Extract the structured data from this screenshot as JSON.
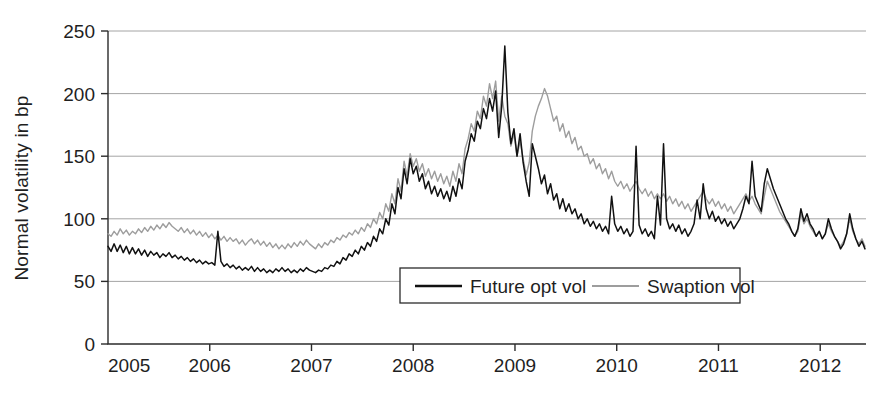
{
  "chart_data": {
    "type": "line",
    "title": "",
    "subtitle": "",
    "xlabel": "",
    "ylabel": "Normal volatility in bp",
    "xlim": [
      2005.0,
      2012.45
    ],
    "ylim": [
      0,
      250
    ],
    "yticks": [
      0,
      50,
      100,
      150,
      200,
      250
    ],
    "ytick_labels": [
      "0",
      "50",
      "100",
      "150",
      "200",
      "250"
    ],
    "xticks": [
      2005,
      2006,
      2007,
      2008,
      2009,
      2010,
      2011,
      2012
    ],
    "xtick_labels": [
      "2005",
      "2006",
      "2007",
      "2008",
      "2009",
      "2010",
      "2011",
      "2012"
    ],
    "grid": "horizontal-only",
    "grid_color": "#9a9a9a",
    "legend_position": "lower-center",
    "series": [
      {
        "name": "Future opt vol",
        "color": "#111111",
        "x": [
          2005.0,
          2005.03,
          2005.06,
          2005.09,
          2005.12,
          2005.15,
          2005.18,
          2005.21,
          2005.24,
          2005.27,
          2005.3,
          2005.33,
          2005.36,
          2005.39,
          2005.42,
          2005.45,
          2005.48,
          2005.51,
          2005.54,
          2005.57,
          2005.6,
          2005.63,
          2005.66,
          2005.69,
          2005.72,
          2005.75,
          2005.78,
          2005.81,
          2005.84,
          2005.87,
          2005.9,
          2005.93,
          2005.96,
          2005.99,
          2006.02,
          2006.05,
          2006.08,
          2006.11,
          2006.14,
          2006.17,
          2006.2,
          2006.23,
          2006.26,
          2006.29,
          2006.32,
          2006.35,
          2006.38,
          2006.41,
          2006.44,
          2006.47,
          2006.5,
          2006.53,
          2006.56,
          2006.59,
          2006.62,
          2006.65,
          2006.68,
          2006.71,
          2006.74,
          2006.77,
          2006.8,
          2006.83,
          2006.86,
          2006.89,
          2006.92,
          2006.95,
          2006.98,
          2007.01,
          2007.04,
          2007.07,
          2007.1,
          2007.13,
          2007.16,
          2007.19,
          2007.22,
          2007.25,
          2007.28,
          2007.31,
          2007.34,
          2007.37,
          2007.4,
          2007.43,
          2007.46,
          2007.49,
          2007.52,
          2007.55,
          2007.58,
          2007.61,
          2007.64,
          2007.67,
          2007.7,
          2007.73,
          2007.76,
          2007.79,
          2007.82,
          2007.85,
          2007.88,
          2007.91,
          2007.94,
          2007.97,
          2008.0,
          2008.03,
          2008.06,
          2008.09,
          2008.12,
          2008.15,
          2008.18,
          2008.21,
          2008.24,
          2008.27,
          2008.3,
          2008.33,
          2008.36,
          2008.39,
          2008.42,
          2008.45,
          2008.48,
          2008.51,
          2008.54,
          2008.57,
          2008.6,
          2008.63,
          2008.66,
          2008.69,
          2008.72,
          2008.75,
          2008.78,
          2008.81,
          2008.84,
          2008.87,
          2008.9,
          2008.93,
          2008.96,
          2008.99,
          2009.02,
          2009.05,
          2009.08,
          2009.11,
          2009.14,
          2009.17,
          2009.2,
          2009.23,
          2009.26,
          2009.29,
          2009.32,
          2009.35,
          2009.38,
          2009.41,
          2009.44,
          2009.47,
          2009.5,
          2009.53,
          2009.56,
          2009.59,
          2009.62,
          2009.65,
          2009.68,
          2009.71,
          2009.74,
          2009.77,
          2009.8,
          2009.83,
          2009.86,
          2009.89,
          2009.92,
          2009.95,
          2009.98,
          2010.01,
          2010.04,
          2010.07,
          2010.1,
          2010.13,
          2010.16,
          2010.19,
          2010.22,
          2010.25,
          2010.28,
          2010.31,
          2010.34,
          2010.37,
          2010.4,
          2010.43,
          2010.46,
          2010.49,
          2010.52,
          2010.55,
          2010.58,
          2010.61,
          2010.64,
          2010.67,
          2010.7,
          2010.73,
          2010.76,
          2010.79,
          2010.82,
          2010.85,
          2010.88,
          2010.91,
          2010.94,
          2010.97,
          2011.0,
          2011.03,
          2011.06,
          2011.09,
          2011.12,
          2011.15,
          2011.18,
          2011.21,
          2011.24,
          2011.27,
          2011.3,
          2011.33,
          2011.36,
          2011.39,
          2011.42,
          2011.45,
          2011.48,
          2011.51,
          2011.54,
          2011.57,
          2011.6,
          2011.63,
          2011.66,
          2011.69,
          2011.72,
          2011.75,
          2011.78,
          2011.81,
          2011.84,
          2011.87,
          2011.9,
          2011.93,
          2011.96,
          2011.99,
          2012.02,
          2012.05,
          2012.08,
          2012.11,
          2012.14,
          2012.17,
          2012.2,
          2012.23,
          2012.26,
          2012.29,
          2012.32,
          2012.35,
          2012.38,
          2012.41,
          2012.44
        ],
        "values": [
          78,
          74,
          80,
          74,
          79,
          73,
          78,
          72,
          77,
          72,
          76,
          71,
          75,
          70,
          74,
          71,
          73,
          69,
          72,
          70,
          73,
          69,
          71,
          68,
          70,
          67,
          69,
          66,
          68,
          65,
          67,
          64,
          66,
          64,
          65,
          63,
          90,
          66,
          62,
          64,
          61,
          63,
          60,
          62,
          59,
          61,
          59,
          62,
          58,
          61,
          58,
          60,
          57,
          59,
          57,
          60,
          58,
          61,
          58,
          60,
          57,
          59,
          57,
          60,
          58,
          61,
          59,
          58,
          57,
          59,
          58,
          61,
          60,
          63,
          62,
          66,
          64,
          69,
          67,
          72,
          70,
          75,
          72,
          78,
          75,
          81,
          78,
          86,
          82,
          92,
          88,
          100,
          95,
          112,
          104,
          125,
          116,
          140,
          128,
          148,
          136,
          142,
          130,
          136,
          124,
          130,
          120,
          126,
          118,
          124,
          116,
          122,
          114,
          126,
          118,
          132,
          124,
          146,
          155,
          168,
          162,
          178,
          172,
          188,
          180,
          196,
          186,
          202,
          165,
          190,
          238,
          185,
          160,
          172,
          150,
          168,
          145,
          130,
          118,
          160,
          150,
          140,
          128,
          135,
          120,
          128,
          115,
          120,
          108,
          116,
          106,
          112,
          104,
          108,
          100,
          104,
          96,
          100,
          94,
          98,
          92,
          96,
          90,
          94,
          88,
          118,
          96,
          90,
          94,
          88,
          92,
          86,
          90,
          158,
          95,
          88,
          92,
          86,
          90,
          84,
          118,
          95,
          160,
          100,
          92,
          96,
          90,
          95,
          88,
          92,
          86,
          90,
          96,
          115,
          100,
          128,
          108,
          100,
          106,
          98,
          102,
          96,
          100,
          94,
          98,
          92,
          96,
          100,
          108,
          118,
          112,
          146,
          118,
          112,
          106,
          128,
          140,
          132,
          124,
          118,
          112,
          106,
          100,
          96,
          90,
          86,
          92,
          108,
          98,
          104,
          96,
          92,
          86,
          90,
          84,
          88,
          100,
          92,
          86,
          82,
          76,
          80,
          88,
          104,
          92,
          84,
          78,
          82,
          76
        ]
      },
      {
        "name": "Swaption vol",
        "color": "#9d9d9d",
        "x": [
          2005.0,
          2005.03,
          2005.06,
          2005.09,
          2005.12,
          2005.15,
          2005.18,
          2005.21,
          2005.24,
          2005.27,
          2005.3,
          2005.33,
          2005.36,
          2005.39,
          2005.42,
          2005.45,
          2005.48,
          2005.51,
          2005.54,
          2005.57,
          2005.6,
          2005.63,
          2005.66,
          2005.69,
          2005.72,
          2005.75,
          2005.78,
          2005.81,
          2005.84,
          2005.87,
          2005.9,
          2005.93,
          2005.96,
          2005.99,
          2006.02,
          2006.05,
          2006.08,
          2006.11,
          2006.14,
          2006.17,
          2006.2,
          2006.23,
          2006.26,
          2006.29,
          2006.32,
          2006.35,
          2006.38,
          2006.41,
          2006.44,
          2006.47,
          2006.5,
          2006.53,
          2006.56,
          2006.59,
          2006.62,
          2006.65,
          2006.68,
          2006.71,
          2006.74,
          2006.77,
          2006.8,
          2006.83,
          2006.86,
          2006.89,
          2006.92,
          2006.95,
          2006.98,
          2007.01,
          2007.04,
          2007.07,
          2007.1,
          2007.13,
          2007.16,
          2007.19,
          2007.22,
          2007.25,
          2007.28,
          2007.31,
          2007.34,
          2007.37,
          2007.4,
          2007.43,
          2007.46,
          2007.49,
          2007.52,
          2007.55,
          2007.58,
          2007.61,
          2007.64,
          2007.67,
          2007.7,
          2007.73,
          2007.76,
          2007.79,
          2007.82,
          2007.85,
          2007.88,
          2007.91,
          2007.94,
          2007.97,
          2008.0,
          2008.03,
          2008.06,
          2008.09,
          2008.12,
          2008.15,
          2008.18,
          2008.21,
          2008.24,
          2008.27,
          2008.3,
          2008.33,
          2008.36,
          2008.39,
          2008.42,
          2008.45,
          2008.48,
          2008.51,
          2008.54,
          2008.57,
          2008.6,
          2008.63,
          2008.66,
          2008.69,
          2008.72,
          2008.75,
          2008.78,
          2008.81,
          2008.84,
          2008.87,
          2008.9,
          2008.93,
          2008.96,
          2008.99,
          2009.02,
          2009.05,
          2009.08,
          2009.11,
          2009.14,
          2009.17,
          2009.2,
          2009.23,
          2009.26,
          2009.29,
          2009.32,
          2009.35,
          2009.38,
          2009.41,
          2009.44,
          2009.47,
          2009.5,
          2009.53,
          2009.56,
          2009.59,
          2009.62,
          2009.65,
          2009.68,
          2009.71,
          2009.74,
          2009.77,
          2009.8,
          2009.83,
          2009.86,
          2009.89,
          2009.92,
          2009.95,
          2009.98,
          2010.01,
          2010.04,
          2010.07,
          2010.1,
          2010.13,
          2010.16,
          2010.19,
          2010.22,
          2010.25,
          2010.28,
          2010.31,
          2010.34,
          2010.37,
          2010.4,
          2010.43,
          2010.46,
          2010.49,
          2010.52,
          2010.55,
          2010.58,
          2010.61,
          2010.64,
          2010.67,
          2010.7,
          2010.73,
          2010.76,
          2010.79,
          2010.82,
          2010.85,
          2010.88,
          2010.91,
          2010.94,
          2010.97,
          2011.0,
          2011.03,
          2011.06,
          2011.09,
          2011.12,
          2011.15,
          2011.18,
          2011.21,
          2011.24,
          2011.27,
          2011.3,
          2011.33,
          2011.36,
          2011.39,
          2011.42,
          2011.45,
          2011.48,
          2011.51,
          2011.54,
          2011.57,
          2011.6,
          2011.63,
          2011.66,
          2011.69,
          2011.72,
          2011.75,
          2011.78,
          2011.81,
          2011.84,
          2011.87,
          2011.9,
          2011.93,
          2011.96,
          2011.99,
          2012.02,
          2012.05,
          2012.08,
          2012.11,
          2012.14,
          2012.17,
          2012.2,
          2012.23,
          2012.26,
          2012.29,
          2012.32,
          2012.35,
          2012.38,
          2012.41,
          2012.44
        ],
        "values": [
          88,
          86,
          90,
          87,
          92,
          88,
          91,
          87,
          90,
          88,
          92,
          89,
          93,
          90,
          94,
          91,
          95,
          92,
          96,
          93,
          97,
          94,
          92,
          90,
          93,
          89,
          92,
          88,
          91,
          87,
          90,
          86,
          89,
          85,
          88,
          84,
          87,
          83,
          86,
          82,
          85,
          82,
          84,
          80,
          83,
          79,
          82,
          84,
          80,
          83,
          79,
          82,
          78,
          81,
          77,
          80,
          76,
          79,
          76,
          80,
          77,
          81,
          78,
          82,
          79,
          83,
          80,
          78,
          76,
          80,
          77,
          81,
          79,
          83,
          81,
          85,
          83,
          87,
          85,
          89,
          87,
          91,
          88,
          93,
          90,
          96,
          93,
          100,
          96,
          105,
          100,
          112,
          106,
          120,
          112,
          132,
          122,
          146,
          134,
          152,
          142,
          148,
          138,
          144,
          134,
          140,
          132,
          138,
          130,
          136,
          128,
          134,
          126,
          138,
          130,
          144,
          136,
          156,
          164,
          176,
          170,
          186,
          180,
          198,
          190,
          208,
          196,
          210,
          178,
          198,
          182,
          176,
          158,
          168,
          150,
          162,
          148,
          135,
          145,
          170,
          182,
          190,
          196,
          204,
          198,
          188,
          178,
          182,
          170,
          176,
          165,
          170,
          160,
          165,
          155,
          158,
          150,
          152,
          144,
          148,
          140,
          144,
          136,
          140,
          132,
          138,
          130,
          126,
          130,
          124,
          128,
          122,
          126,
          130,
          124,
          120,
          124,
          118,
          122,
          116,
          120,
          116,
          120,
          114,
          118,
          112,
          116,
          110,
          114,
          108,
          112,
          106,
          110,
          114,
          118,
          122,
          116,
          112,
          116,
          110,
          114,
          108,
          112,
          106,
          110,
          104,
          108,
          112,
          116,
          120,
          114,
          118,
          112,
          108,
          104,
          118,
          130,
          124,
          118,
          112,
          106,
          102,
          98,
          94,
          90,
          86,
          90,
          104,
          96,
          100,
          94,
          90,
          86,
          90,
          84,
          88,
          96,
          90,
          86,
          82,
          78,
          82,
          88,
          100,
          90,
          84,
          80,
          84,
          78
        ]
      }
    ]
  },
  "axes": {
    "ylabel": "Normal volatility in bp"
  },
  "legend": {
    "entries": [
      {
        "label": "Future opt vol",
        "color": "#111111"
      },
      {
        "label": "Swaption vol",
        "color": "#9d9d9d"
      }
    ]
  }
}
